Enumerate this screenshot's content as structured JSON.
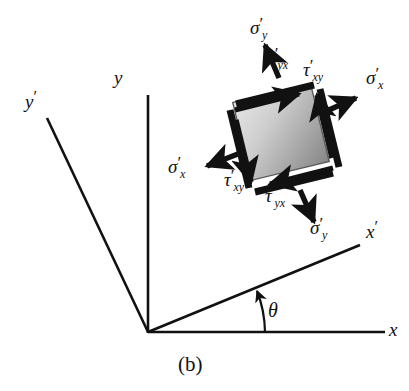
{
  "figure": {
    "caption": "(b)",
    "type": "stress-element-transformation-diagram",
    "background_color": "#ffffff",
    "line_color": "#111111",
    "element_fill_light": "#dcdcdc",
    "element_fill_dark": "#8c8c8c"
  },
  "axes": {
    "x": {
      "label": "x",
      "prime": ""
    },
    "y": {
      "label": "y",
      "prime": ""
    },
    "x_prime": {
      "label": "x",
      "prime": "′"
    },
    "y_prime": {
      "label": "y",
      "prime": "′"
    },
    "angle": {
      "label": "θ",
      "value_deg": 20
    }
  },
  "stresses": [
    {
      "id": "sigma-y-prime-top",
      "symbol": "σ",
      "prime": "′",
      "subscript": "y",
      "position": "top"
    },
    {
      "id": "tau-yx-prime-top",
      "symbol": "τ",
      "prime": "′",
      "subscript": "yx",
      "position": "top-face"
    },
    {
      "id": "tau-xy-prime-right",
      "symbol": "τ",
      "prime": "′",
      "subscript": "xy",
      "position": "right-face"
    },
    {
      "id": "sigma-x-prime-right",
      "symbol": "σ",
      "prime": "′",
      "subscript": "x",
      "position": "right"
    },
    {
      "id": "sigma-x-prime-left",
      "symbol": "σ",
      "prime": "′",
      "subscript": "x",
      "position": "left"
    },
    {
      "id": "tau-xy-prime-left",
      "symbol": "τ",
      "prime": "′",
      "subscript": "xy",
      "position": "left-face"
    },
    {
      "id": "tau-yx-prime-bottom",
      "symbol": "τ",
      "prime": "′",
      "subscript": "yx",
      "position": "bottom-face"
    },
    {
      "id": "sigma-y-prime-bottom",
      "symbol": "σ",
      "prime": "′",
      "subscript": "y",
      "position": "bottom"
    }
  ]
}
